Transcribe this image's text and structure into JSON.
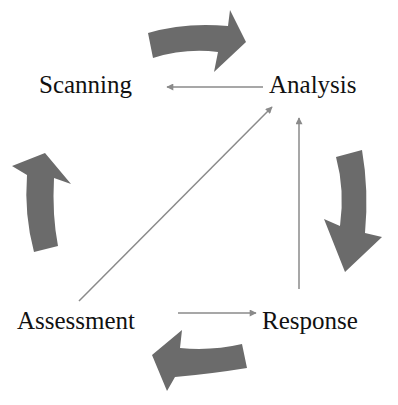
{
  "diagram": {
    "title": "",
    "nodes": {
      "scanning": "Scanning",
      "analysis": "Analysis",
      "response": "Response",
      "assessment": "Assessment"
    },
    "edges": [
      {
        "from": "Analysis",
        "to": "Scanning",
        "style": "thin-arrow"
      },
      {
        "from": "Assessment",
        "to": "Response",
        "style": "thin-arrow"
      },
      {
        "from": "Response",
        "to": "Analysis",
        "style": "thin-arrow"
      },
      {
        "from": "Assessment",
        "to": "Analysis",
        "style": "thin-arrow"
      }
    ],
    "cycle_arrows": [
      {
        "position": "top",
        "direction": "clockwise",
        "icon": "curved-arrow-right"
      },
      {
        "position": "right",
        "direction": "clockwise",
        "icon": "curved-arrow-down"
      },
      {
        "position": "bottom",
        "direction": "clockwise",
        "icon": "curved-arrow-left"
      },
      {
        "position": "left",
        "direction": "clockwise",
        "icon": "curved-arrow-up"
      }
    ],
    "colors": {
      "cycle_arrow_fill": "#6b6b6b",
      "thin_arrow": "#8a8a8a",
      "text": "#111111",
      "background": "#ffffff"
    }
  }
}
